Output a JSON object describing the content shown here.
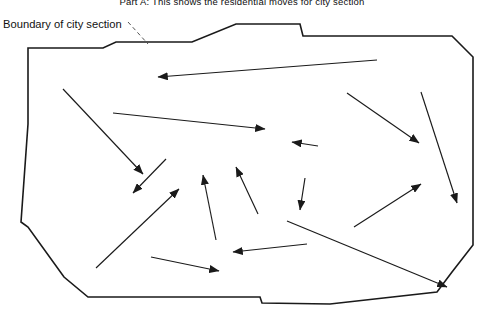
{
  "figure": {
    "title": "Part A: This shows the residential moves for city section",
    "boundary_label": "Boundary of city section",
    "stroke_color": "#1a1a1a",
    "arrow_color": "#1a1a1a",
    "background_color": "#ffffff",
    "leader_line_style": "dashed"
  },
  "chart_data": {
    "type": "map",
    "title": "Part A: This shows the residential moves for city section",
    "xlabel": "",
    "ylabel": "",
    "legend_position": "top-left",
    "grid": false,
    "annotations": [
      {
        "text": "Boundary of city section",
        "x": 3,
        "y": 24,
        "leader_to_x": 148,
        "leader_to_y": 44,
        "style": "dashed-leader"
      }
    ],
    "boundary": {
      "name": "city-section-boundary",
      "closed": true,
      "vertices": [
        [
          28,
          48
        ],
        [
          103,
          48
        ],
        [
          116,
          42
        ],
        [
          190,
          42
        ],
        [
          192,
          42
        ],
        [
          236,
          24
        ],
        [
          300,
          24
        ],
        [
          303,
          36
        ],
        [
          452,
          36
        ],
        [
          473,
          57
        ],
        [
          473,
          245
        ],
        [
          452,
          272
        ],
        [
          437,
          292
        ],
        [
          330,
          304
        ],
        [
          262,
          303
        ],
        [
          260,
          297
        ],
        [
          88,
          297
        ],
        [
          64,
          277
        ],
        [
          28,
          227
        ],
        [
          21,
          222
        ],
        [
          28,
          124
        ]
      ]
    },
    "arrows": [
      {
        "id": 1,
        "x1": 377,
        "y1": 60,
        "x2": 158,
        "y2": 77,
        "direction": "west"
      },
      {
        "id": 2,
        "x1": 63,
        "y1": 89,
        "x2": 143,
        "y2": 174,
        "direction": "southeast"
      },
      {
        "id": 3,
        "x1": 113,
        "y1": 113,
        "x2": 265,
        "y2": 129,
        "direction": "east"
      },
      {
        "id": 4,
        "x1": 166,
        "y1": 159,
        "x2": 133,
        "y2": 193,
        "direction": "southwest"
      },
      {
        "id": 5,
        "x1": 318,
        "y1": 146,
        "x2": 292,
        "y2": 142,
        "direction": "west"
      },
      {
        "id": 6,
        "x1": 347,
        "y1": 93,
        "x2": 419,
        "y2": 143,
        "direction": "southeast"
      },
      {
        "id": 7,
        "x1": 421,
        "y1": 92,
        "x2": 457,
        "y2": 203,
        "direction": "south"
      },
      {
        "id": 8,
        "x1": 305,
        "y1": 178,
        "x2": 300,
        "y2": 210,
        "direction": "south"
      },
      {
        "id": 9,
        "x1": 258,
        "y1": 214,
        "x2": 236,
        "y2": 167,
        "direction": "north"
      },
      {
        "id": 10,
        "x1": 216,
        "y1": 240,
        "x2": 203,
        "y2": 175,
        "direction": "north"
      },
      {
        "id": 11,
        "x1": 96,
        "y1": 268,
        "x2": 179,
        "y2": 189,
        "direction": "northeast"
      },
      {
        "id": 12,
        "x1": 354,
        "y1": 227,
        "x2": 421,
        "y2": 184,
        "direction": "northeast"
      },
      {
        "id": 13,
        "x1": 307,
        "y1": 244,
        "x2": 233,
        "y2": 252,
        "direction": "west"
      },
      {
        "id": 14,
        "x1": 151,
        "y1": 257,
        "x2": 219,
        "y2": 271,
        "direction": "east"
      },
      {
        "id": 15,
        "x1": 287,
        "y1": 221,
        "x2": 447,
        "y2": 287,
        "direction": "southeast"
      }
    ]
  }
}
